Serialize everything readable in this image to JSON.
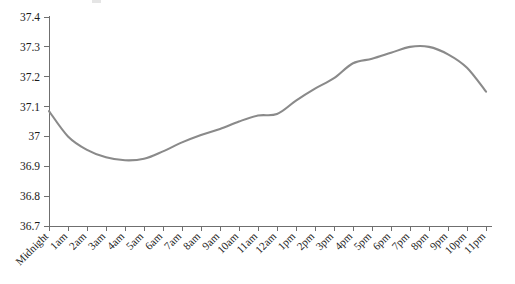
{
  "chart_data": {
    "type": "line",
    "title": "",
    "subtitle": "",
    "xlabel": "",
    "ylabel": "",
    "categories": [
      "Midnight",
      "1am",
      "2am",
      "3am",
      "4am",
      "5am",
      "6am",
      "7am",
      "8am",
      "9am",
      "10am",
      "11am",
      "12am",
      "1pm",
      "2pm",
      "3pm",
      "4pm",
      "5pm",
      "6pm",
      "7pm",
      "8pm",
      "9pm",
      "10pm",
      "11pm"
    ],
    "values": [
      37.085,
      37.0,
      36.955,
      36.93,
      36.92,
      36.925,
      36.95,
      36.98,
      37.005,
      37.025,
      37.05,
      37.07,
      37.075,
      37.12,
      37.16,
      37.195,
      37.245,
      37.26,
      37.28,
      37.3,
      37.3,
      37.275,
      37.23,
      37.15
    ],
    "series": [
      {
        "name": "Body temperature",
        "values": [
          37.085,
          37.0,
          36.955,
          36.93,
          36.92,
          36.925,
          36.95,
          36.98,
          37.005,
          37.025,
          37.05,
          37.07,
          37.075,
          37.12,
          37.16,
          37.195,
          37.245,
          37.26,
          37.28,
          37.3,
          37.3,
          37.275,
          37.23,
          37.15
        ],
        "color": "#8a8a8a"
      }
    ],
    "ylim": [
      36.7,
      37.4
    ],
    "yticks": [
      36.7,
      36.8,
      36.9,
      37.0,
      37.1,
      37.2,
      37.3,
      37.4
    ],
    "ytick_labels": [
      "36.7",
      "36.8",
      "36.9",
      "37",
      "37.1",
      "37.2",
      "37.3",
      "37.4"
    ],
    "grid": false,
    "legend": false,
    "legend_position": "none",
    "line_color": "#8a8a8a",
    "axis_color": "#6f6f6f",
    "background_color": "#ffffff",
    "xtick_label_rotation": -45,
    "annotations": []
  }
}
